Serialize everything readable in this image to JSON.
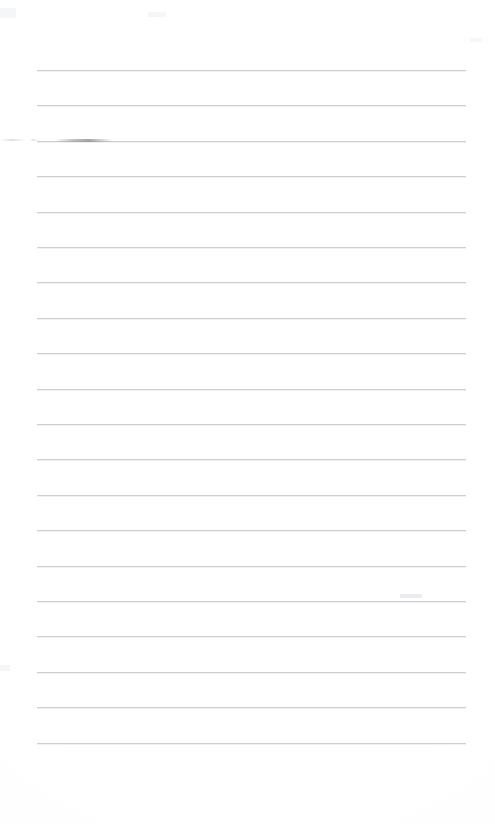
{
  "document": {
    "kind": "lined-paper-page",
    "title": "Blank ruled notebook page",
    "content_text": "",
    "width_px": 495,
    "height_px": 824,
    "background_color": "#ffffff",
    "rule_color": "#c9ccd1",
    "rule_halo_color": "#eef0f2"
  },
  "ruling": {
    "line_count": 20,
    "first_line_y": 70,
    "line_spacing_px": 35.4,
    "line_start_x": 37,
    "line_end_x": 466,
    "line_thickness_px": 1,
    "left_margin_px": 37,
    "right_margin_px": 29,
    "top_margin_px": 70,
    "bottom_margin_px": 81,
    "lines": [
      {
        "index": 1,
        "y": 70
      },
      {
        "index": 2,
        "y": 105
      },
      {
        "index": 3,
        "y": 141
      },
      {
        "index": 4,
        "y": 176
      },
      {
        "index": 5,
        "y": 212
      },
      {
        "index": 6,
        "y": 247
      },
      {
        "index": 7,
        "y": 282
      },
      {
        "index": 8,
        "y": 318
      },
      {
        "index": 9,
        "y": 353
      },
      {
        "index": 10,
        "y": 389
      },
      {
        "index": 11,
        "y": 424
      },
      {
        "index": 12,
        "y": 459
      },
      {
        "index": 13,
        "y": 495
      },
      {
        "index": 14,
        "y": 530
      },
      {
        "index": 15,
        "y": 566
      },
      {
        "index": 16,
        "y": 601
      },
      {
        "index": 17,
        "y": 636
      },
      {
        "index": 18,
        "y": 672
      },
      {
        "index": 19,
        "y": 707
      },
      {
        "index": 20,
        "y": 743
      }
    ]
  },
  "artifacts": {
    "description": "faint scan marks visible on the otherwise blank page",
    "items": [
      {
        "name": "line-3-smudge",
        "x": 55,
        "y": 139,
        "width": 58,
        "height": 3,
        "color": "#8c8f94"
      },
      {
        "name": "left-margin-fleck",
        "x": 0,
        "y": 139,
        "width": 26,
        "height": 2,
        "color": "#c4c7cc"
      },
      {
        "name": "left-margin-fleck-2",
        "x": 30,
        "y": 139,
        "width": 8,
        "height": 2,
        "color": "#c4c7cc"
      },
      {
        "name": "top-left-corner-tint",
        "x": 0,
        "y": 8,
        "width": 16,
        "height": 10,
        "color": "#f3f4f6"
      },
      {
        "name": "right-edge-speck",
        "x": 470,
        "y": 38,
        "width": 12,
        "height": 4,
        "color": "#f3f4f6"
      },
      {
        "name": "line-16-speck",
        "x": 400,
        "y": 594,
        "width": 22,
        "height": 4,
        "color": "#e8eaed"
      },
      {
        "name": "mid-page-speck",
        "x": 148,
        "y": 12,
        "width": 18,
        "height": 5,
        "color": "#f3f4f6"
      },
      {
        "name": "line-18-left-tint",
        "x": 0,
        "y": 665,
        "width": 10,
        "height": 6,
        "color": "#f3f4f6"
      }
    ]
  },
  "writing_areas": {
    "label": "writable ruled rows",
    "count": 20,
    "placeholder": ""
  }
}
